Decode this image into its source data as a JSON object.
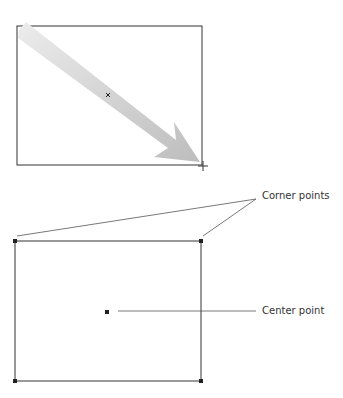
{
  "diagram": {
    "top_panel": {
      "frame": {
        "x": 17,
        "y": 26,
        "w": 185,
        "h": 139
      },
      "arrow": {
        "from": [
          20,
          30
        ],
        "to": [
          200,
          162
        ],
        "color": "#c8c8c8"
      },
      "center_marker": {
        "x": 108,
        "y": 95
      },
      "cursor": {
        "x": 203,
        "y": 166,
        "icon": "crosshair-cursor-icon"
      }
    },
    "bottom_panel": {
      "frame": {
        "x": 15,
        "y": 241,
        "w": 186,
        "h": 140
      },
      "corner_points": [
        [
          15,
          241
        ],
        [
          201,
          241
        ],
        [
          15,
          381
        ],
        [
          201,
          381
        ]
      ],
      "center_point": {
        "x": 107,
        "y": 312
      }
    },
    "labels": {
      "corner_points": "Corner points",
      "center_point": "Center point"
    },
    "colors": {
      "line": "#333333",
      "arrow_fill": "#c8c8c8"
    }
  }
}
